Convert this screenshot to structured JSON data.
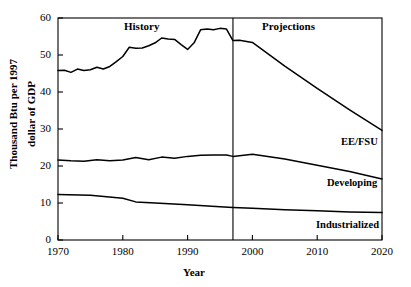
{
  "chart_data": {
    "type": "line",
    "title": "",
    "xlabel": "Year",
    "ylabel": "Thousand Btu per 1997 dollar of GDP",
    "xlim": [
      1970,
      2020
    ],
    "ylim": [
      0,
      60
    ],
    "xticks": [
      1970,
      1980,
      1990,
      2000,
      2010,
      2020
    ],
    "yticks": [
      0,
      10,
      20,
      30,
      40,
      50,
      60
    ],
    "grid": false,
    "legend_position": "inline-right",
    "annotations": [
      {
        "text": "History",
        "x": 1985,
        "y": 58
      },
      {
        "text": "Projections",
        "x": 2006,
        "y": 58
      },
      {
        "text": "divider",
        "x": 1997,
        "y": null
      }
    ],
    "divider_x": 1997,
    "series": [
      {
        "name": "EE/FSU",
        "label": "EE/FSU",
        "x": [
          1970,
          1971,
          1972,
          1973,
          1974,
          1975,
          1976,
          1977,
          1978,
          1979,
          1980,
          1981,
          1982,
          1983,
          1984,
          1985,
          1986,
          1987,
          1988,
          1989,
          1990,
          1991,
          1992,
          1993,
          1994,
          1995,
          1996,
          1997,
          1998,
          2000,
          2005,
          2010,
          2015,
          2020
        ],
        "values": [
          45.8,
          45.9,
          45.3,
          46.2,
          45.8,
          46.0,
          46.7,
          46.2,
          46.9,
          48.2,
          49.6,
          52.1,
          51.8,
          51.9,
          52.5,
          53.3,
          54.6,
          54.3,
          54.2,
          52.8,
          51.5,
          53.3,
          56.8,
          57.0,
          56.8,
          57.2,
          57.0,
          53.9,
          54.0,
          53.4,
          47.0,
          41.0,
          35.2,
          29.6
        ]
      },
      {
        "name": "Developing",
        "label": "Developing",
        "x": [
          1970,
          1972,
          1974,
          1976,
          1978,
          1980,
          1982,
          1984,
          1986,
          1988,
          1990,
          1992,
          1994,
          1996,
          1997,
          1998,
          2000,
          2005,
          2010,
          2015,
          2020
        ],
        "values": [
          21.6,
          21.4,
          21.3,
          21.7,
          21.4,
          21.6,
          22.3,
          21.7,
          22.4,
          22.1,
          22.6,
          22.9,
          23.0,
          23.0,
          22.6,
          22.8,
          23.2,
          21.9,
          20.2,
          18.5,
          16.5
        ]
      },
      {
        "name": "Industrialized",
        "label": "Industrialized",
        "x": [
          1970,
          1975,
          1980,
          1982,
          1985,
          1990,
          1995,
          1997,
          2000,
          2005,
          2010,
          2015,
          2020
        ],
        "values": [
          12.3,
          12.1,
          11.3,
          10.3,
          10.0,
          9.5,
          9.0,
          8.8,
          8.6,
          8.2,
          7.9,
          7.6,
          7.4
        ]
      }
    ]
  },
  "axes": {
    "xlabel": "Year",
    "ylabel": "Thousand Btu per 1997 dollar of GDP",
    "xticklabels": [
      "1970",
      "1980",
      "1990",
      "2000",
      "2010",
      "2020"
    ],
    "yticklabels": [
      "0",
      "10",
      "20",
      "30",
      "40",
      "50",
      "60"
    ]
  },
  "labels": {
    "history": "History",
    "projections": "Projections",
    "ee_fsu": "EE/FSU",
    "developing": "Developing",
    "industrialized": "Industrialized"
  },
  "colors": {
    "line": "#000000",
    "axis": "#000000",
    "background": "#ffffff"
  }
}
